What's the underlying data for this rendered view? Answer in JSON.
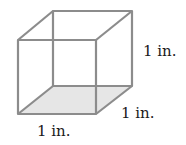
{
  "diagram": {
    "shape": "cube",
    "edge_color": "#8c8c8c",
    "base_fill": "#e6e6e6",
    "labels": {
      "height": "1 in.",
      "depth": "1 in.",
      "width": "1 in."
    }
  }
}
